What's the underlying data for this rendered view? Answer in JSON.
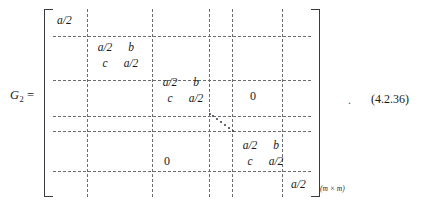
{
  "figure": {
    "kind": "block-tridiagonal-matrix-equation",
    "lhs": {
      "symbol": "G",
      "subscript": "2",
      "equals": "="
    },
    "equation_number": "(4.2.36)",
    "trailing_punctuation": ".",
    "size_subscript": "(m × m)",
    "brackets": {
      "left": "[",
      "right": "]"
    },
    "matrix": {
      "blocks": [
        {
          "id": "block-1-scalar",
          "kind": "scalar",
          "value": "a/2"
        },
        {
          "id": "block-2-two-by-two",
          "kind": "2x2",
          "row1": [
            "a/2",
            "b"
          ],
          "row2": [
            "c",
            "a/2"
          ]
        },
        {
          "id": "block-3-two-by-two",
          "kind": "2x2",
          "row1": [
            "a/2",
            "b"
          ],
          "row2": [
            "c",
            "a/2"
          ]
        },
        {
          "id": "block-4-two-by-two",
          "kind": "2x2",
          "row1": [
            "a/2",
            "b"
          ],
          "row2": [
            "c",
            "a/2"
          ]
        },
        {
          "id": "block-5-scalar",
          "kind": "scalar",
          "value": "a/2"
        }
      ],
      "zeros": {
        "upper_right": "0",
        "lower_left": "0"
      },
      "ellipsis": "⋱"
    }
  },
  "colors": {
    "background": "#ffffff",
    "text": "#1a1a1a",
    "grid_dashed": "#6b6b72",
    "bracket": "#3a3a44"
  }
}
